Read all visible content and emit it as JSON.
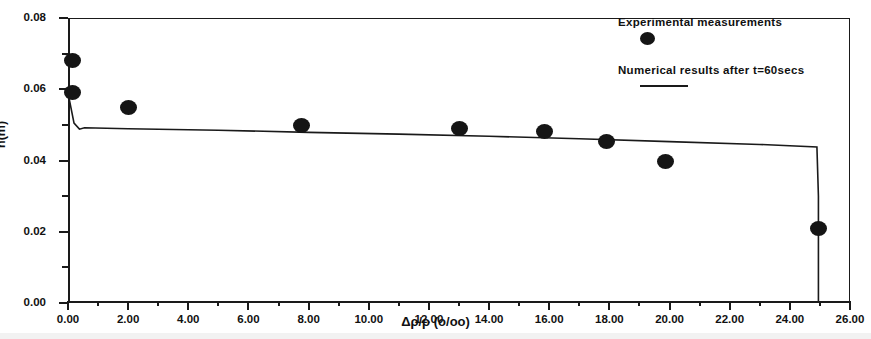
{
  "figure": {
    "background": "#ffffff",
    "ink_color": "#151515"
  },
  "chart_data": {
    "type": "scatter",
    "title": "",
    "xlabel": "Δρ/ρ (o/oo)",
    "ylabel": "h(m)",
    "xlim": [
      0,
      26
    ],
    "ylim": [
      0,
      0.08
    ],
    "grid": false,
    "legend_position": "top-right",
    "x_ticks": [
      0,
      2,
      4,
      6,
      8,
      10,
      12,
      14,
      16,
      18,
      20,
      22,
      24,
      26
    ],
    "x_tick_labels": [
      "0.00",
      "2.00",
      "4.00",
      "6.00",
      "8.00",
      "10.00",
      "12.00",
      "14.00",
      "16.00",
      "18.00",
      "20.00",
      "22.00",
      "24.00",
      "26.00"
    ],
    "x_minor_ticks": [
      1,
      3,
      5,
      7,
      9,
      11,
      13,
      15,
      17,
      19,
      21,
      23,
      25
    ],
    "y_ticks": [
      0.0,
      0.02,
      0.04,
      0.06,
      0.08
    ],
    "y_tick_labels": [
      "0.00",
      "0.02",
      "0.04",
      "0.06",
      "0.08"
    ],
    "y_minor_ticks": [
      0.01,
      0.03,
      0.05,
      0.07
    ],
    "series": [
      {
        "name": "Experimental measurements",
        "type": "scatter",
        "marker": "filled-circle",
        "color": "#151515",
        "points": [
          {
            "x": 0.15,
            "y": 0.068
          },
          {
            "x": 0.15,
            "y": 0.059
          },
          {
            "x": 2.0,
            "y": 0.0548
          },
          {
            "x": 7.75,
            "y": 0.0499
          },
          {
            "x": 13.0,
            "y": 0.0489
          },
          {
            "x": 15.85,
            "y": 0.0481
          },
          {
            "x": 17.9,
            "y": 0.0452
          },
          {
            "x": 19.85,
            "y": 0.0396
          },
          {
            "x": 24.95,
            "y": 0.021
          }
        ]
      },
      {
        "name": "Numerical results after t=60secs",
        "type": "line",
        "color": "#1a1a1a",
        "points": [
          {
            "x": 0.0,
            "y": 0.059
          },
          {
            "x": 0.2,
            "y": 0.0505
          },
          {
            "x": 0.38,
            "y": 0.0488
          },
          {
            "x": 0.55,
            "y": 0.0492
          },
          {
            "x": 2.0,
            "y": 0.0489
          },
          {
            "x": 5.0,
            "y": 0.0485
          },
          {
            "x": 8.0,
            "y": 0.0479
          },
          {
            "x": 11.0,
            "y": 0.0474
          },
          {
            "x": 14.0,
            "y": 0.0468
          },
          {
            "x": 17.0,
            "y": 0.0461
          },
          {
            "x": 20.0,
            "y": 0.0453
          },
          {
            "x": 23.0,
            "y": 0.0445
          },
          {
            "x": 24.9,
            "y": 0.0438
          },
          {
            "x": 24.95,
            "y": 0.03
          },
          {
            "x": 24.95,
            "y": 0.0
          }
        ]
      }
    ]
  },
  "legend": {
    "items": [
      {
        "label": "Experimental measurements",
        "marker": "filled-circle"
      },
      {
        "label": "Numerical results after t=60secs",
        "marker": "line"
      }
    ]
  }
}
